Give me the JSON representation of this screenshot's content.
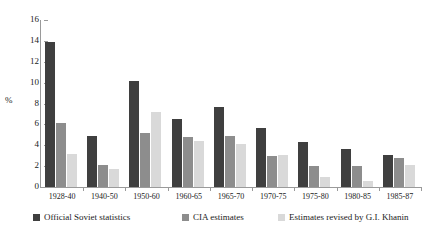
{
  "chart_data": {
    "type": "bar",
    "title": "",
    "xlabel": "",
    "ylabel": "%",
    "ylim": [
      0,
      16
    ],
    "yticks": [
      0,
      2,
      4,
      6,
      8,
      10,
      12,
      14,
      16
    ],
    "grid": false,
    "legend_position": "bottom",
    "categories": [
      "1928-40",
      "1940-50",
      "1950-60",
      "1960-65",
      "1965-70",
      "1970-75",
      "1975-80",
      "1980-85",
      "1985-87"
    ],
    "series": [
      {
        "name": "Official Soviet statistics",
        "color": "#3f3f3f",
        "values": [
          13.9,
          4.9,
          10.2,
          6.5,
          7.7,
          5.7,
          4.3,
          3.6,
          3.1
        ]
      },
      {
        "name": "CIA estimates",
        "color": "#8d8d8d",
        "values": [
          6.1,
          2.1,
          5.2,
          4.8,
          4.9,
          3.0,
          2.0,
          2.0,
          2.8
        ]
      },
      {
        "name": "Estimates revised by G.I. Khanin",
        "color": "#d9d9d9",
        "values": [
          3.2,
          1.7,
          7.2,
          4.4,
          4.1,
          3.1,
          1.0,
          0.6,
          2.1
        ]
      }
    ]
  }
}
